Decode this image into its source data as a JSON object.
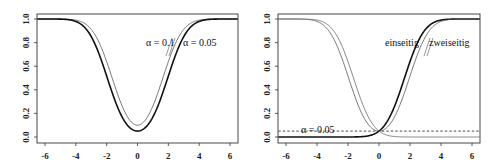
{
  "chart_data": [
    {
      "type": "line",
      "title": "",
      "xlabel": "",
      "ylabel": "",
      "xlim": [
        -6.5,
        6.5
      ],
      "ylim": [
        -0.03,
        1.03
      ],
      "x_ticks": [
        -6,
        -4,
        -2,
        0,
        2,
        4,
        6
      ],
      "x_tick_labels": [
        "-6",
        "-4",
        "-2",
        "0",
        "2",
        "4",
        "6"
      ],
      "y_ticks": [
        0.0,
        0.2,
        0.4,
        0.6,
        0.8,
        1.0
      ],
      "y_tick_labels": [
        "0.0",
        "0.2",
        "0.4",
        "0.6",
        "0.8",
        "1.0"
      ],
      "grid": false,
      "series": [
        {
          "name": "α = 0.1",
          "kind": "two_sided_power",
          "alpha": 0.1,
          "z": 1.6449,
          "stroke_width": 0.8,
          "color": "#555555"
        },
        {
          "name": "α = 0.05",
          "kind": "two_sided_power",
          "alpha": 0.05,
          "z": 1.96,
          "stroke_width": 1.6,
          "color": "#111111"
        }
      ],
      "annotations": [
        {
          "text": "α = 0.1",
          "x": 1.8,
          "y": 0.75
        },
        {
          "text": "α = 0.05",
          "x": 3.9,
          "y": 0.75
        }
      ],
      "upper_line": {
        "y": 1.0
      }
    },
    {
      "type": "line",
      "title": "",
      "xlabel": "",
      "ylabel": "",
      "xlim": [
        -6.5,
        6.5
      ],
      "ylim": [
        -0.03,
        1.03
      ],
      "x_ticks": [
        -6,
        -4,
        -2,
        0,
        2,
        4,
        6
      ],
      "x_tick_labels": [
        "-6",
        "-4",
        "-2",
        "0",
        "2",
        "4",
        "6"
      ],
      "y_ticks": [
        0.0,
        0.2,
        0.4,
        0.6,
        0.8,
        1.0
      ],
      "y_tick_labels": [
        "0.0",
        "0.2",
        "0.4",
        "0.6",
        "0.8",
        "1.0"
      ],
      "grid": false,
      "series": [
        {
          "name": "einseitig",
          "kind": "one_sided_right",
          "alpha": 0.05,
          "z": 1.6449,
          "stroke_width": 1.6,
          "color": "#111111"
        },
        {
          "name": "zweiseitig",
          "kind": "two_sided_power",
          "alpha": 0.05,
          "z": 1.96,
          "stroke_width": 0.8,
          "color": "#555555"
        },
        {
          "name": "einseitig (links)",
          "kind": "one_sided_left",
          "alpha": 0.05,
          "z": 1.6449,
          "stroke_width": 0.8,
          "color": "#666666"
        }
      ],
      "reference_lines": [
        {
          "y": 0.05,
          "style": "dashed",
          "label": "α = 0.05"
        }
      ],
      "annotations": [
        {
          "text": "einseitig",
          "x": 1.2,
          "y": 0.75
        },
        {
          "text": "zweiseitig",
          "x": 3.5,
          "y": 0.75
        },
        {
          "text": "α = 0.05",
          "x": -4.2,
          "y": 0.07
        }
      ],
      "upper_line": {
        "y": 1.0
      }
    }
  ],
  "panels": [
    {
      "label_a": "α = 0.1",
      "label_b": "α = 0.05"
    },
    {
      "label_a": "einseitig",
      "label_b": "zweiseitig",
      "label_c": "α = 0.05"
    }
  ]
}
